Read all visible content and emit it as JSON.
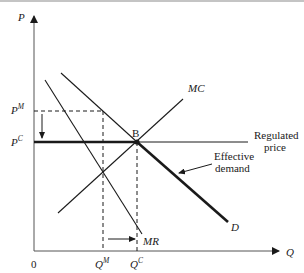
{
  "diagram": {
    "type": "monopoly price regulation",
    "axes": {
      "y_label": "P",
      "x_label": "Q",
      "origin_label": "0"
    },
    "price_labels": [
      {
        "base": "P",
        "sup": "M"
      },
      {
        "base": "P",
        "sup": "C"
      }
    ],
    "quantity_labels": [
      {
        "base": "Q",
        "sup": "M"
      },
      {
        "base": "Q",
        "sup": "C"
      }
    ],
    "curves": {
      "mc": "MC",
      "mr": "MR",
      "d": "D"
    },
    "point_label": "B",
    "annotations": {
      "regulated_price_line1": "Regulated",
      "regulated_price_line2": "price",
      "effective_demand_line1": "Effective",
      "effective_demand_line2": "demand"
    },
    "colors": {
      "line": "#1a1a1a",
      "top_rule": "#8a8a8a"
    }
  }
}
